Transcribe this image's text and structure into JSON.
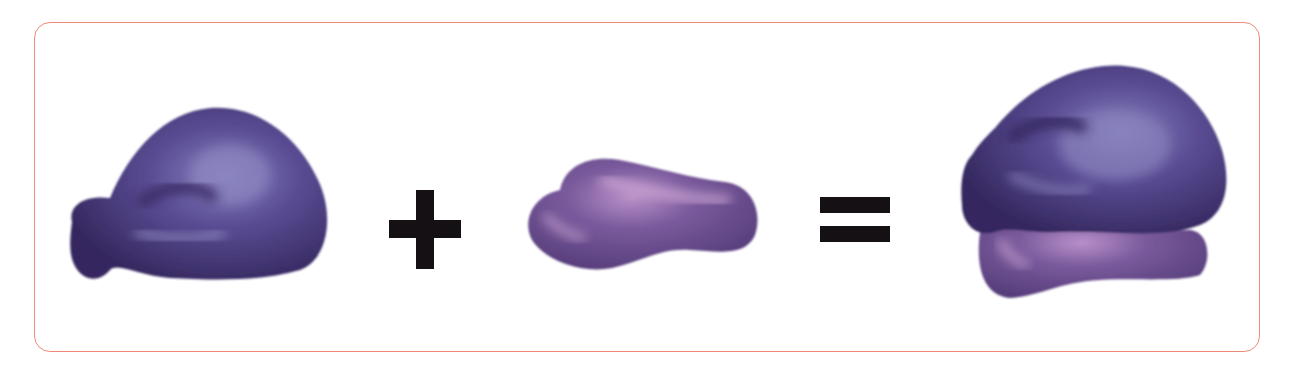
{
  "figure": {
    "components": [
      {
        "id": "large-subunit",
        "role": "operand"
      },
      {
        "id": "plus",
        "role": "operator",
        "symbol": "+"
      },
      {
        "id": "small-subunit",
        "role": "operand"
      },
      {
        "id": "equals",
        "role": "operator",
        "symbol": "="
      },
      {
        "id": "assembled-ribosome",
        "role": "result"
      }
    ],
    "colors": {
      "border": "#f08a78",
      "large_subunit": "#3e2f6e",
      "large_highlight": "#8a84c0",
      "small_subunit": "#6a4a8a",
      "small_highlight": "#c8a0d0",
      "operators": "#111111"
    }
  }
}
